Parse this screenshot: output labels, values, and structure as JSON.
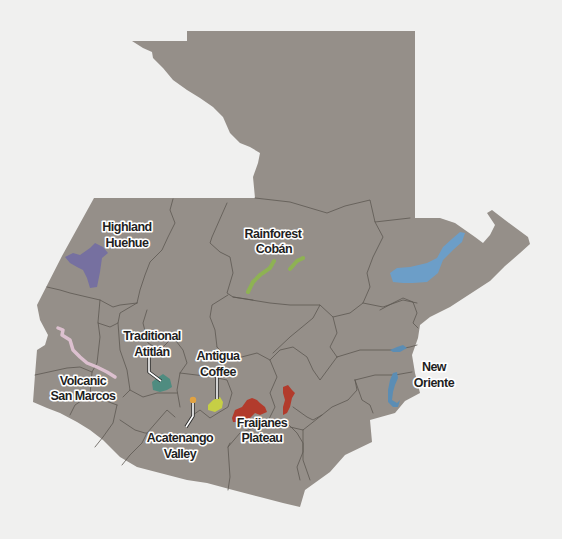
{
  "map": {
    "background": "#f0f0ef",
    "land_color": "#958f89",
    "border_color": "#5d5852"
  },
  "regions": {
    "highland_huehue": {
      "line1": "Highland",
      "line2": "Huehue",
      "color": "#7670a0"
    },
    "rainforest_coban": {
      "line1": "Rainforest",
      "line2": "Cobán",
      "color": "#8db84a"
    },
    "traditional_atitlan": {
      "line1": "Traditional",
      "line2": "Atitlán",
      "color": "#4f8c80"
    },
    "antigua_coffee": {
      "line1": "Antigua",
      "line2": "Coffee",
      "color": "#c6cf45"
    },
    "volcanic_san_marcos": {
      "line1": "Volcanic",
      "line2": "San Marcos",
      "color": "#dcc0cf"
    },
    "acatenango_valley": {
      "line1": "Acatenango",
      "line2": "Valley",
      "color": "#e9a43a"
    },
    "fraijanes_plateau": {
      "line1": "Fraijanes",
      "line2": "Plateau",
      "color": "#b23b2c"
    },
    "new_oriente": {
      "line1": "New",
      "line2": "Oriente",
      "color": "#5b8db4"
    },
    "unlabeled_east": {
      "color": "#6c9ec8"
    }
  }
}
